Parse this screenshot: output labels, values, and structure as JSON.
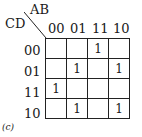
{
  "kmap": {
    "row_var": "CD",
    "col_var": "AB",
    "col_labels": [
      "00",
      "01",
      "11",
      "10"
    ],
    "row_labels": [
      "00",
      "01",
      "11",
      "10"
    ],
    "cells": [
      [
        "",
        "",
        "1",
        ""
      ],
      [
        "",
        "1",
        "",
        "1"
      ],
      [
        "1",
        "",
        "",
        ""
      ],
      [
        "",
        "1",
        "",
        "1"
      ]
    ],
    "caption": "(c)"
  }
}
